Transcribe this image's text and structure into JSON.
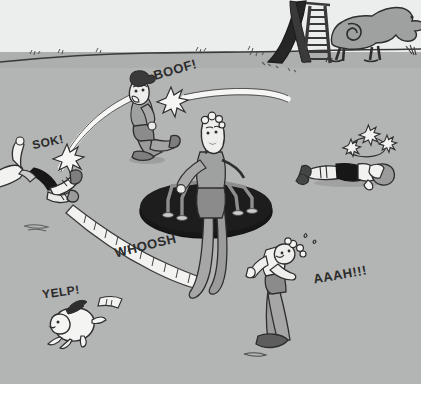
{
  "scene": {
    "title": "Playground merry-go-round chaos cartoon",
    "medium": "hand-drawn cartoon illustration, grey wash",
    "setting": "playground field with horizon line"
  },
  "palette": {
    "sky": "#eceded",
    "ground": "#b3b4b4",
    "ground_shade": "#a8a9a9",
    "ink": "#2b2b2b",
    "white": "#f4f4f2",
    "mid_grey": "#9a9b9a",
    "dark_grey": "#6e6f6e",
    "black": "#171717",
    "paper": "#ffffff"
  },
  "sound_effects": [
    {
      "text": "BOOF!",
      "name": "sfx-boof",
      "x": 153,
      "y": 62,
      "size": 13,
      "rotate": -16
    },
    {
      "text": "SOK!",
      "name": "sfx-sok",
      "x": 32,
      "y": 135,
      "size": 12,
      "rotate": -12
    },
    {
      "text": "WHOOSH",
      "name": "sfx-whoosh",
      "x": 114,
      "y": 238,
      "size": 13,
      "rotate": -14
    },
    {
      "text": "YELP!",
      "name": "sfx-yelp",
      "x": 42,
      "y": 285,
      "size": 12,
      "rotate": -8
    },
    {
      "text": "AAAH!!!",
      "name": "sfx-aaah",
      "x": 313,
      "y": 267,
      "size": 13,
      "rotate": -10
    }
  ],
  "characters": [
    {
      "name": "spinner-kid-center",
      "description": "kid clinging to merry-go-round, legs stretched out by spin"
    },
    {
      "name": "flung-kid-left",
      "description": "kid flung off frame at left edge, legs up"
    },
    {
      "name": "struck-kid-boof",
      "description": "kid knocked backwards, dark curly hair, mouth open"
    },
    {
      "name": "knocked-out-kid-right",
      "description": "kid face down on ground, stars orbiting head"
    },
    {
      "name": "fleeing-kid-right",
      "description": "kid running away screaming"
    },
    {
      "name": "fleeing-dog",
      "description": "small white dog running off, ears back"
    }
  ],
  "props": [
    {
      "name": "merry-go-round",
      "description": "black disc roundabout with grey metal grab bars"
    },
    {
      "name": "slide",
      "description": "dark playground slide with ladder, top right"
    },
    {
      "name": "dinosaur-climber",
      "description": "grey dinosaur play structure with spiral marking"
    },
    {
      "name": "horizon-line",
      "description": "ground / sky dividing line across upper area"
    },
    {
      "name": "motion-arc-sok",
      "description": "white swoosh arc for left impact trajectory"
    },
    {
      "name": "motion-arc-boof",
      "description": "white straight swoosh for BOOF impact"
    },
    {
      "name": "motion-trail-whoosh",
      "description": "long ribbon trail with tick marks"
    },
    {
      "name": "impact-star-sok",
      "description": "white burst star"
    },
    {
      "name": "impact-star-boof",
      "description": "white burst star"
    },
    {
      "name": "dizzy-stars",
      "description": "three stars on orbit ring above KO'd kid"
    }
  ]
}
